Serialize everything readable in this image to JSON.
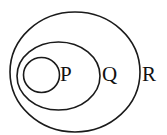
{
  "diagram": {
    "type": "venn-nested-sets",
    "sets": [
      {
        "label": "P",
        "contained_in": "Q"
      },
      {
        "label": "Q",
        "contained_in": "R"
      },
      {
        "label": "R",
        "contained_in": null
      }
    ],
    "stroke_color": "#1a1a1a",
    "background": "#ffffff"
  }
}
